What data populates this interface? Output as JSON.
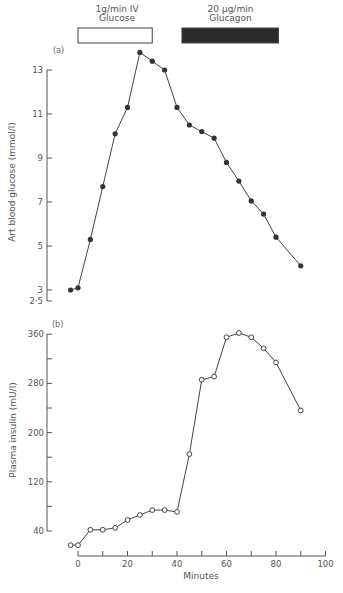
{
  "chart_data": [
    {
      "type": "line",
      "panel_label": "(a)",
      "title": "",
      "xlabel": "Minutes",
      "ylabel": "Art blood glucose (mmol/l)",
      "yticks": [
        2.5,
        3,
        5,
        7,
        9,
        11,
        13
      ],
      "ytick_labels": [
        "2·5",
        "3",
        "5",
        "7",
        "9",
        "11",
        "13"
      ],
      "ylim": [
        2.5,
        13.8
      ],
      "marker": "filled-circle",
      "x": [
        -3,
        0,
        5,
        10,
        15,
        20,
        25,
        30,
        35,
        40,
        45,
        50,
        55,
        60,
        65,
        70,
        75,
        80,
        90
      ],
      "series": [
        {
          "name": "Art blood glucose",
          "values": [
            3.0,
            3.1,
            5.3,
            7.7,
            10.1,
            11.3,
            13.8,
            13.4,
            13.0,
            11.3,
            10.5,
            10.2,
            9.9,
            8.8,
            7.95,
            7.05,
            6.45,
            5.4,
            4.1
          ]
        }
      ],
      "grid": false
    },
    {
      "type": "line",
      "panel_label": "(b)",
      "title": "",
      "xlabel": "Minutes",
      "ylabel": "Plasma insulin (mU/l)",
      "yticks": [
        40,
        80,
        120,
        160,
        200,
        240,
        280,
        320,
        360
      ],
      "ytick_labels": [
        "40",
        "",
        "120",
        "",
        "200",
        "",
        "280",
        "",
        "360"
      ],
      "ylim": [
        40,
        360
      ],
      "xticks": [
        0,
        10,
        20,
        30,
        40,
        50,
        60,
        70,
        80,
        90,
        100
      ],
      "xtick_labels": [
        "0",
        "",
        "20",
        "",
        "40",
        "",
        "60",
        "",
        "80",
        "",
        "100"
      ],
      "xlim": [
        0,
        100
      ],
      "marker": "open-circle",
      "x": [
        -3,
        0,
        5,
        10,
        15,
        20,
        25,
        30,
        35,
        40,
        45,
        50,
        55,
        60,
        65,
        70,
        75,
        80,
        90
      ],
      "series": [
        {
          "name": "Plasma insulin",
          "values": [
            17,
            17,
            42,
            42,
            45,
            58,
            66,
            74,
            74,
            71,
            165,
            286,
            291,
            355,
            362,
            355,
            337,
            314,
            236
          ]
        }
      ],
      "grid": false
    }
  ],
  "infusions": [
    {
      "label_line1": "1g/min IV",
      "label_line2": "Glucose",
      "start": 0,
      "end": 30,
      "fill": "open"
    },
    {
      "label_line1": "20 μg/min",
      "label_line2": "Glucagon",
      "start": 42,
      "end": 81,
      "fill": "#2b2b2b"
    }
  ],
  "axis_labels": {
    "x": "Minutes",
    "y_top": "Art blood glucose (mmol/l)",
    "y_bottom": "Plasma insulin (mU/l)",
    "panel_a": "(a)",
    "panel_b": "(b)"
  }
}
